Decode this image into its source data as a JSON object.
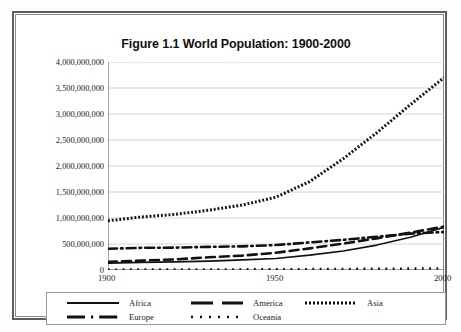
{
  "chart_data": {
    "type": "line",
    "title": "Figure 1.1 World Population: 1900-2000",
    "xlabel": "",
    "ylabel": "",
    "xlim": [
      1900,
      2000
    ],
    "ylim": [
      0,
      4000000000
    ],
    "grid": true,
    "legend_position": "bottom",
    "ytick_labels": [
      "4,000,000,000",
      "3,500,000,000",
      "3,000,000,000",
      "2,500,000,000",
      "2,000,000,000",
      "1,500,000,000",
      "1,000,000,000",
      "500,000,000",
      "0"
    ],
    "yticks": [
      4000000000,
      3500000000,
      3000000000,
      2500000000,
      2000000000,
      1500000000,
      1000000000,
      500000000,
      0
    ],
    "xtick_labels": [
      "1900",
      "1950",
      "2000"
    ],
    "xticks": [
      1900,
      1950,
      2000
    ],
    "x": [
      1900,
      1910,
      1920,
      1930,
      1940,
      1950,
      1960,
      1970,
      1980,
      1990,
      2000
    ],
    "series": [
      {
        "name": "Africa",
        "style": "solid",
        "color": "#111111",
        "values": [
          133000000,
          145000000,
          155000000,
          172000000,
          195000000,
          221000000,
          285000000,
          366000000,
          480000000,
          630000000,
          820000000
        ]
      },
      {
        "name": "America",
        "style": "dashed",
        "color": "#111111",
        "values": [
          156000000,
          180000000,
          205000000,
          244000000,
          277000000,
          332000000,
          416000000,
          508000000,
          608000000,
          718000000,
          835000000
        ]
      },
      {
        "name": "Asia",
        "style": "dotted-dense",
        "color": "#111111",
        "values": [
          947000000,
          1020000000,
          1070000000,
          1150000000,
          1250000000,
          1400000000,
          1700000000,
          2140000000,
          2640000000,
          3180000000,
          3700000000
        ]
      },
      {
        "name": "Europe",
        "style": "dash-dot",
        "color": "#111111",
        "values": [
          408000000,
          427000000,
          430000000,
          445000000,
          455000000,
          480000000,
          530000000,
          580000000,
          640000000,
          700000000,
          730000000
        ]
      },
      {
        "name": "Oceania",
        "style": "dotted",
        "color": "#111111",
        "values": [
          6000000,
          7000000,
          8000000,
          10000000,
          11000000,
          13000000,
          16000000,
          19000000,
          23000000,
          26000000,
          31000000
        ]
      }
    ]
  },
  "legend": {
    "items": [
      {
        "label": "Africa",
        "key": "legend-key-solid"
      },
      {
        "label": "America",
        "key": "legend-key-dashed"
      },
      {
        "label": "Asia",
        "key": "legend-key-dotted-dense"
      },
      {
        "label": "Europe",
        "key": "legend-key-dash-dot"
      },
      {
        "label": "Oceania",
        "key": "legend-key-dotted"
      }
    ]
  },
  "colors": {
    "line": "#111111",
    "grid": "#c9c9c9",
    "axis": "#555555",
    "frame": "#5e5e5e",
    "background": "#ffffff"
  }
}
